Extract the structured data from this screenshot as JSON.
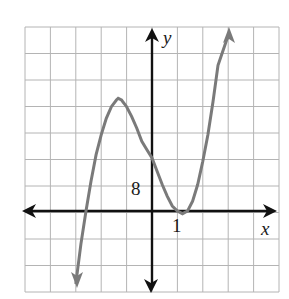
{
  "chart_data": {
    "type": "line",
    "title": "",
    "xlabel": "x",
    "ylabel": "y",
    "x_tick_label": "1",
    "y_tick_label": "8",
    "x_scale_per_grid": 1,
    "y_scale_per_grid": 8,
    "xlim": [
      -5,
      5
    ],
    "ylim": [
      -24,
      56
    ],
    "grid": true,
    "grid_cells": {
      "columns": 10,
      "rows": 10
    },
    "colors": {
      "curve": "#7a7a7a",
      "axes": "#111111",
      "grid": "#b4b4b4"
    },
    "series": [
      {
        "name": "f(x)",
        "x": [
          -3.0,
          -2.8,
          -2.6,
          -2.4,
          -2.2,
          -2.0,
          -1.8,
          -1.6,
          -1.4,
          -1.33,
          -1.2,
          -1.0,
          -0.8,
          -0.6,
          -0.4,
          -0.2,
          0.0,
          0.2,
          0.4,
          0.6,
          0.8,
          1.0,
          1.2,
          1.4,
          1.6,
          1.8,
          2.0,
          2.2,
          2.4,
          2.6,
          3.0
        ],
        "y": [
          -22,
          -10,
          0,
          9,
          17,
          23,
          28,
          31.5,
          33.5,
          34,
          33.5,
          31.5,
          28.5,
          25,
          21,
          18.5,
          16,
          12,
          8,
          4.5,
          1.5,
          0,
          -0.8,
          0,
          3,
          8,
          15,
          23,
          33,
          44,
          58
        ]
      }
    ],
    "annotations": [
      {
        "text": "8",
        "position": "y-axis tick, one grid above origin"
      },
      {
        "text": "1",
        "position": "x-axis tick, one grid right of origin"
      }
    ]
  },
  "labels": {
    "x_axis": "x",
    "y_axis": "y",
    "x_tick": "1",
    "y_tick": "8"
  }
}
